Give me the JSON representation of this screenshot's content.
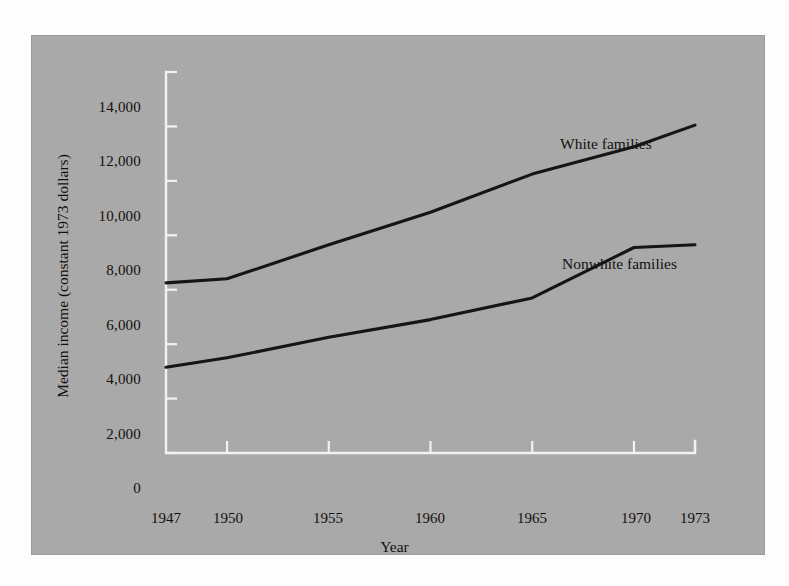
{
  "chart_data": {
    "type": "line",
    "title": "",
    "xlabel": "Year",
    "ylabel": "Median income (constant 1973 dollars)",
    "x": [
      1947,
      1950,
      1955,
      1960,
      1965,
      1970,
      1973
    ],
    "xtick_labels": [
      "1947",
      "1950",
      "1955",
      "1960",
      "1965",
      "1970",
      "1973"
    ],
    "ytick_labels": [
      "14,000",
      "12,000",
      "10,000",
      "8,000",
      "6,000",
      "4,000",
      "2,000",
      "0"
    ],
    "yticks": [
      14000,
      12000,
      10000,
      8000,
      6000,
      4000,
      2000,
      0
    ],
    "xlim": [
      1947,
      1973
    ],
    "ylim": [
      0,
      14000
    ],
    "grid": false,
    "legend_position": "inline-annotations",
    "series": [
      {
        "name": "White families",
        "label": "White families",
        "color": "#151515",
        "values": [
          6250,
          6400,
          7650,
          8850,
          10250,
          11250,
          12050
        ]
      },
      {
        "name": "Nonwhite families",
        "label": "Nonwhite families",
        "color": "#151515",
        "values": [
          3150,
          3500,
          4250,
          4900,
          5700,
          7550,
          7650
        ]
      }
    ],
    "background_color": "#a9a9a9",
    "axis_color": "#f2f2f2",
    "text_color": "#14100e"
  }
}
